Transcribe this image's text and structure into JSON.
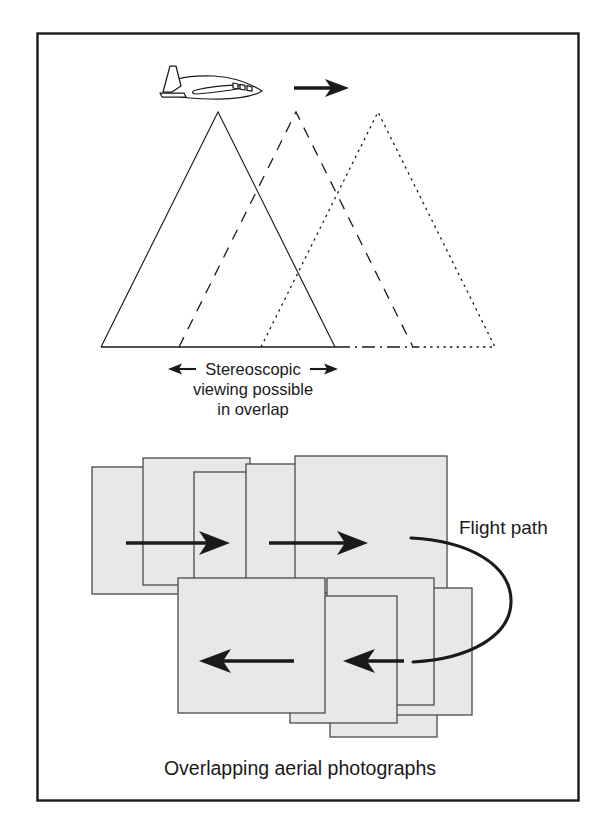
{
  "figure": {
    "kind": "aerial-photography-overlap-diagram",
    "border_color": "#1a1a1a",
    "background_color": "#ffffff",
    "line_color": "#1a1a1a",
    "photo_fill_color": "#e8e8e8",
    "photo_border_color": "#4a4a4a"
  },
  "upper_panel": {
    "aircraft": {
      "icon": "airplane-side-view-icon",
      "heading": "right"
    },
    "direction_arrow": {
      "icon": "arrow-right-icon",
      "direction": "right"
    },
    "exposures": [
      {
        "name": "exposure-1",
        "line_style": "solid",
        "apex_label": ""
      },
      {
        "name": "exposure-2",
        "line_style": "dashed",
        "apex_label": ""
      },
      {
        "name": "exposure-3",
        "line_style": "dotted",
        "apex_label": ""
      }
    ],
    "ground_line": {
      "name": "ground-line",
      "left_style": "solid",
      "right_style": "dash-dot"
    },
    "overlap_measure": {
      "left_arrow_icon": "arrow-left-icon",
      "right_arrow_icon": "arrow-right-icon",
      "line1": "Stereoscopic",
      "line2": "viewing possible",
      "line3": "in overlap"
    }
  },
  "lower_panel": {
    "caption": "Overlapping aerial photographs",
    "flight_path_label": "Flight path",
    "flight_path_curve": {
      "name": "flight-path-curve",
      "shape": "u-turn"
    },
    "strip_arrows": [
      {
        "name": "strip-arrow-forward-1",
        "direction": "right"
      },
      {
        "name": "strip-arrow-forward-2",
        "direction": "right"
      },
      {
        "name": "strip-arrow-return-1",
        "direction": "left"
      },
      {
        "name": "strip-arrow-return-2",
        "direction": "left"
      }
    ],
    "photo_strips": [
      {
        "name": "strip-outbound",
        "direction": "right",
        "photos": [
          {
            "name": "photo-1"
          },
          {
            "name": "photo-2"
          },
          {
            "name": "photo-3"
          },
          {
            "name": "photo-4"
          },
          {
            "name": "photo-5"
          }
        ]
      },
      {
        "name": "strip-return",
        "direction": "left",
        "photos": [
          {
            "name": "photo-6"
          },
          {
            "name": "photo-7"
          },
          {
            "name": "photo-8"
          },
          {
            "name": "photo-9"
          },
          {
            "name": "photo-10"
          }
        ]
      }
    ]
  }
}
